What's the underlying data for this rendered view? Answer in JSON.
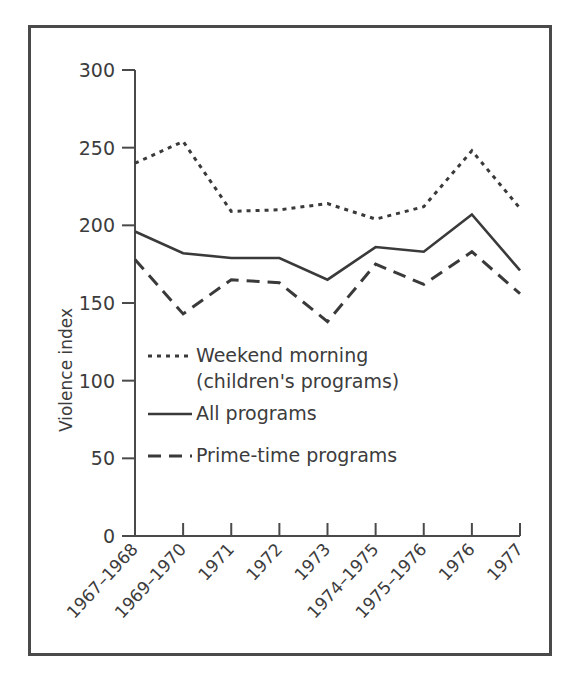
{
  "figure": {
    "frame_color": "#4a4a4a",
    "background": "#ffffff",
    "line_color": "#3a3a3a"
  },
  "axis": {
    "y_title": "Violence index",
    "y_ticks": [
      "300",
      "250",
      "200",
      "150",
      "100",
      "50",
      "0"
    ],
    "x_labels": [
      "1967–1968",
      "1969–1970",
      "1971",
      "1972",
      "1973",
      "1974–1975",
      "1975–1976",
      "1976",
      "1977"
    ]
  },
  "legend": {
    "items": [
      {
        "label_line1": "Weekend morning",
        "label_line2": "(children's programs)",
        "style": "dotted"
      },
      {
        "label_line1": "All programs",
        "label_line2": "",
        "style": "solid"
      },
      {
        "label_line1": "Prime-time programs",
        "label_line2": "",
        "style": "dashed"
      }
    ]
  },
  "chart_data": {
    "type": "line",
    "title": "",
    "xlabel": "",
    "ylabel": "Violence index",
    "ylim": [
      0,
      300
    ],
    "ytick_step": 50,
    "grid": false,
    "legend_position": "inside-lower-left",
    "categories": [
      "1967–1968",
      "1969–1970",
      "1971",
      "1972",
      "1973",
      "1974–1975",
      "1975–1976",
      "1976",
      "1977"
    ],
    "series": [
      {
        "name": "Weekend morning (children's programs)",
        "style": "dotted",
        "values": [
          240,
          254,
          209,
          210,
          214,
          204,
          212,
          248,
          211
        ]
      },
      {
        "name": "All programs",
        "style": "solid",
        "values": [
          196,
          182,
          179,
          179,
          165,
          186,
          183,
          207,
          171
        ]
      },
      {
        "name": "Prime-time programs",
        "style": "dashed",
        "values": [
          178,
          143,
          165,
          163,
          138,
          175,
          162,
          183,
          156
        ]
      }
    ]
  }
}
